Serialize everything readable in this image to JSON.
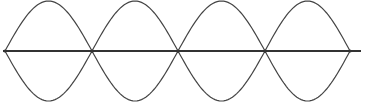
{
  "diagram": {
    "type": "standing-wave",
    "loops": 4,
    "nodes_x": [
      5,
      92,
      178,
      265,
      350
    ],
    "axis": {
      "x1": 3,
      "x2": 361,
      "y": 51
    },
    "amplitude_top_y": 1,
    "amplitude_bottom_y": 101,
    "colors": {
      "background": "#ffffff",
      "axis": "#333333",
      "wave": "#444444"
    }
  }
}
